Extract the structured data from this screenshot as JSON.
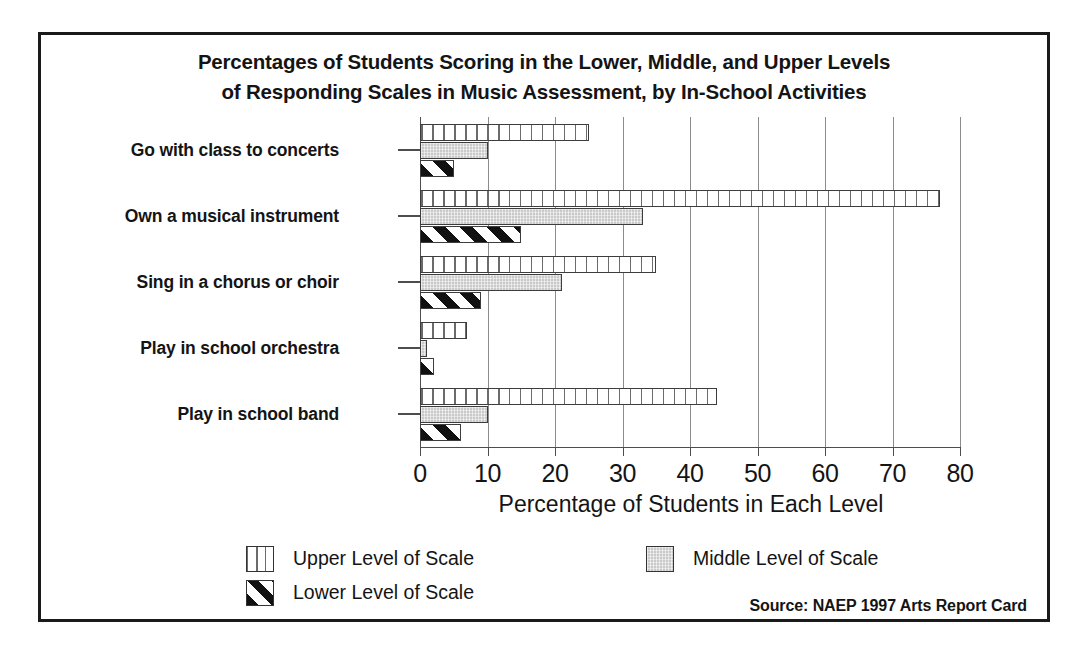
{
  "figure": {
    "title_lines": [
      "Percentages of Students Scoring in the Lower, Middle, and Upper Levels",
      "of Responding Scales in Music Assessment, by In-School Activities"
    ],
    "source": "Source: NAEP 1997 Arts Report Card"
  },
  "chart_data": {
    "type": "bar",
    "orientation": "horizontal",
    "title": "Percentages of Students Scoring in the Lower, Middle, and Upper Levels of Responding Scales in Music Assessment, by In-School Activities",
    "xlabel": "Percentage of Students in Each Level",
    "ylabel": "",
    "xlim": [
      0,
      80
    ],
    "xticks": [
      0,
      10,
      20,
      30,
      40,
      50,
      60,
      70,
      80
    ],
    "xticklabels": [
      "0",
      "10",
      "20",
      "30",
      "40",
      "50",
      "60",
      "70",
      "80"
    ],
    "grid": "vertical",
    "legend_position": "bottom",
    "categories": [
      "Go with class to concerts",
      "Own a musical instrument",
      "Sing in a chorus or choir",
      "Play in school orchestra",
      "Play in school band"
    ],
    "series": [
      {
        "name": "Upper Level of Scale",
        "pattern": "vertical-lines",
        "values": [
          25,
          77,
          35,
          7,
          44
        ]
      },
      {
        "name": "Middle Level of Scale",
        "pattern": "solid-gray",
        "values": [
          10,
          33,
          21,
          1,
          10
        ]
      },
      {
        "name": "Lower Level of Scale",
        "pattern": "diagonal-hatch",
        "values": [
          5,
          15,
          9,
          2,
          6
        ]
      }
    ]
  },
  "legend": {
    "entries": [
      {
        "label": "Upper Level of Scale",
        "pattern": "vertical-lines"
      },
      {
        "label": "Middle Level of Scale",
        "pattern": "solid-gray"
      },
      {
        "label": "Lower Level of Scale",
        "pattern": "diagonal-hatch"
      }
    ]
  },
  "colors": {
    "frame": "#1a1a1a",
    "gridline": "#8c8c8c",
    "axis": "#4d4d4d",
    "bar_outline": "#3d3d3d",
    "middle_fill": "#c9c9c9",
    "hatch": "#111111",
    "text": "#141414"
  }
}
